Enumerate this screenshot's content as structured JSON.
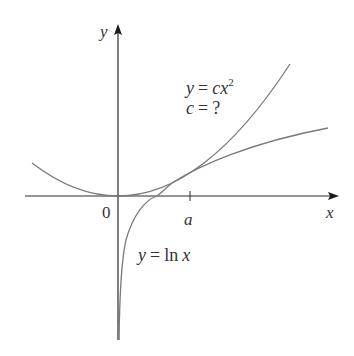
{
  "figure": {
    "axes": {
      "x_label": "x",
      "y_label": "y",
      "origin_label": "0",
      "tick_label": "a"
    },
    "curves": {
      "parabola": {
        "equation_lhs": "y",
        "equation_eq": "=",
        "equation_rhs": "cx",
        "exponent": "2",
        "question_lhs": "c",
        "question_eq": "=",
        "question_rhs": "?"
      },
      "log": {
        "label_lhs": "y",
        "label_eq": "=",
        "label_fn": "ln",
        "label_var": "x"
      }
    },
    "colors": {
      "axis": "#1a1a1a",
      "curve": "#7a7a7a",
      "text": "#333333"
    }
  }
}
